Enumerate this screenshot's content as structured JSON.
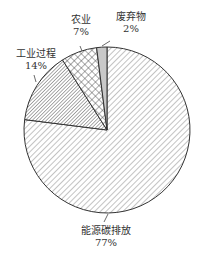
{
  "chart_data": {
    "type": "pie",
    "title": "",
    "slices": [
      {
        "label": "能源碳排放",
        "value": 77,
        "pct_label": "77%",
        "pattern": "diag-fine"
      },
      {
        "label": "工业过程",
        "value": 14,
        "pct_label": "14%",
        "pattern": "diag-dense"
      },
      {
        "label": "农业",
        "value": 7,
        "pct_label": "7%",
        "pattern": "crosshatch"
      },
      {
        "label": "废弃物",
        "value": 2,
        "pct_label": "2%",
        "pattern": "solid-gray"
      }
    ],
    "legend": "none",
    "start_angle_deg_from_top": 0,
    "direction": "clockwise"
  },
  "labels": {
    "energy": {
      "name": "能源碳排放",
      "pct": "77%"
    },
    "industry": {
      "name": "工业过程",
      "pct": "14%"
    },
    "agriculture": {
      "name": "农业",
      "pct": "7%"
    },
    "waste": {
      "name": "废弃物",
      "pct": "2%"
    }
  }
}
